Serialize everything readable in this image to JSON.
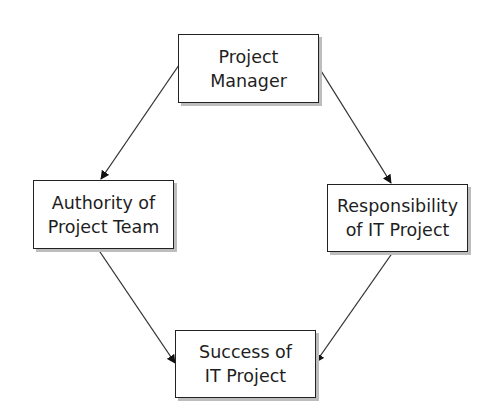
{
  "diagram": {
    "type": "flow",
    "nodes": [
      {
        "id": "pm",
        "lines": [
          "Project",
          "Manager"
        ]
      },
      {
        "id": "apt",
        "lines": [
          "Authority of",
          "Project Team"
        ]
      },
      {
        "id": "rit",
        "lines": [
          "Responsibility",
          "of IT Project"
        ]
      },
      {
        "id": "sit",
        "lines": [
          "Success of",
          "IT Project"
        ]
      }
    ],
    "edges": [
      {
        "from": "Project Manager",
        "to": "Authority of Project Team"
      },
      {
        "from": "Project Manager",
        "to": "Responsibility of IT Project"
      },
      {
        "from": "Authority of Project Team",
        "to": "Success of IT Project"
      },
      {
        "from": "Responsibility of IT Project",
        "to": "Success of IT Project"
      }
    ],
    "colors": {
      "stroke": "#222222",
      "shadow": "#bdbdbd",
      "text": "#1e1e1e"
    }
  }
}
